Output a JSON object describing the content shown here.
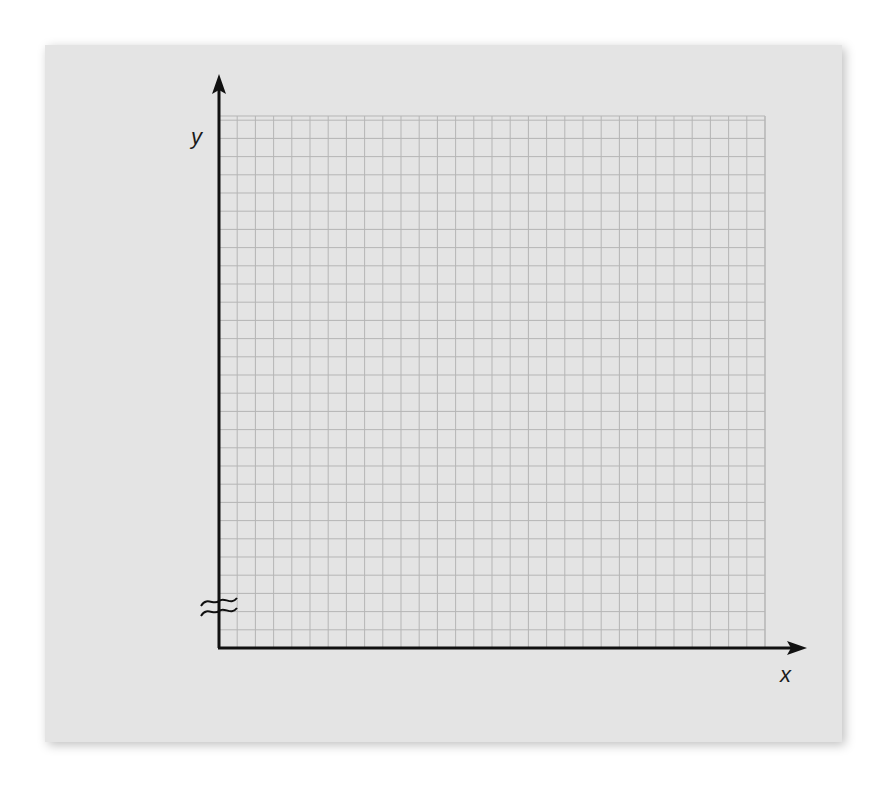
{
  "chart_data": {
    "type": "blank-graph-grid",
    "title": "",
    "xlabel": "x",
    "ylabel": "y",
    "grid": true,
    "grid_columns": 30,
    "grid_rows": 29.5,
    "axis_break": {
      "axis": "y",
      "symbol": "≈",
      "position": "near origin"
    },
    "series": []
  },
  "labels": {
    "x_axis": "x",
    "y_axis": "y"
  },
  "colors": {
    "panel_background": "#e4e4e4",
    "grid_line": "#b5b5b5",
    "axis_line": "#111111"
  }
}
